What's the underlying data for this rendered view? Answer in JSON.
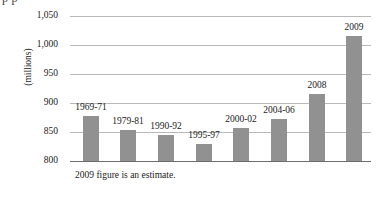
{
  "clipped_header": "p p",
  "footnote": "2009 figure is an estimate.",
  "axis_title": "(millions)",
  "colors": {
    "bar": "#919191",
    "gridline": "#b9b9b9",
    "axis": "#6d6d6d",
    "text": "#1a1a1a",
    "background": "#ffffff"
  },
  "chart_data": {
    "type": "bar",
    "title": "",
    "subtitle": "",
    "xlabel": "",
    "ylabel": "(millions)",
    "ylim": [
      800,
      1050
    ],
    "ytick_labels": [
      "1,050",
      "1,000",
      "950",
      "900",
      "850",
      "800"
    ],
    "yticks": [
      1050,
      1000,
      950,
      900,
      850,
      800
    ],
    "grid": true,
    "legend": "none",
    "annotation": "2009 figure is an estimate.",
    "categories": [
      "1969-71",
      "1979-81",
      "1990-92",
      "1995-97",
      "2000-02",
      "2004-06",
      "2008",
      "2009"
    ],
    "values": [
      878,
      853,
      845,
      830,
      857,
      873,
      915,
      1015
    ],
    "data_labels": [
      "1969-71",
      "1979-81",
      "1990-92",
      "1995-97",
      "2000-02",
      "2004-06",
      "2008",
      "2009"
    ],
    "series": [
      {
        "name": "Undernourished population",
        "values": [
          878,
          853,
          845,
          830,
          857,
          873,
          915,
          1015
        ]
      }
    ]
  }
}
